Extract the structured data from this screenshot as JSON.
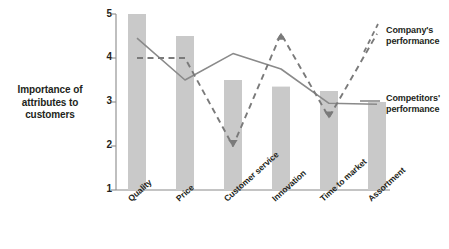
{
  "chart_data": {
    "type": "bar",
    "title": "",
    "subtitle": "",
    "xlabel": "",
    "ylabel": "Importance of\nattributes to\ncustomers",
    "ylim": [
      1,
      5
    ],
    "yticks": [
      1,
      2,
      3,
      4,
      5
    ],
    "ytick_labels": [
      "1",
      "2",
      "3",
      "4",
      "5"
    ],
    "grid": false,
    "legend_position": "right",
    "categories": [
      "Quality",
      "Price",
      "Customer service",
      "Innovation",
      "Time to market",
      "Assortment"
    ],
    "bars": {
      "name": "Importance of attributes to customers",
      "values": [
        5.0,
        4.5,
        3.5,
        3.35,
        3.25,
        3.0
      ],
      "color": "#c9c9c9"
    },
    "series": [
      {
        "name": "Company's performance",
        "style": "dashed",
        "color": "#7a7a7a",
        "values": [
          4.0,
          4.0,
          2.0,
          4.55,
          2.65,
          4.55
        ],
        "markers": [
          {
            "category": "Customer service",
            "type": "arrow-down"
          },
          {
            "category": "Innovation",
            "type": "arrow-up"
          },
          {
            "category": "Time to market",
            "type": "arrow-down"
          }
        ]
      },
      {
        "name": "Competitors' performance",
        "style": "solid",
        "color": "#8a8a8a",
        "values": [
          4.45,
          3.5,
          4.1,
          3.75,
          2.97,
          2.95
        ],
        "markers": []
      }
    ]
  },
  "axis": {
    "y_title": "Importance of attributes to customers",
    "y_title_line1": "Importance of",
    "y_title_line2": "attributes to",
    "y_title_line3": "customers",
    "ticks": [
      "5",
      "4",
      "3",
      "2",
      "1"
    ]
  },
  "legend": {
    "company": "Company's\nperformance",
    "competitors": "Competitors'\nperformance"
  },
  "categories": {
    "c0": "Quality",
    "c1": "Price",
    "c2": "Customer service",
    "c3": "Innovation",
    "c4": "Time to market",
    "c5": "Assortment"
  },
  "colors": {
    "bar": "#c9c9c9",
    "dashed_line": "#7a7a7a",
    "solid_line": "#8a8a8a",
    "axis": "#8a8a8a",
    "text": "#231f20"
  }
}
